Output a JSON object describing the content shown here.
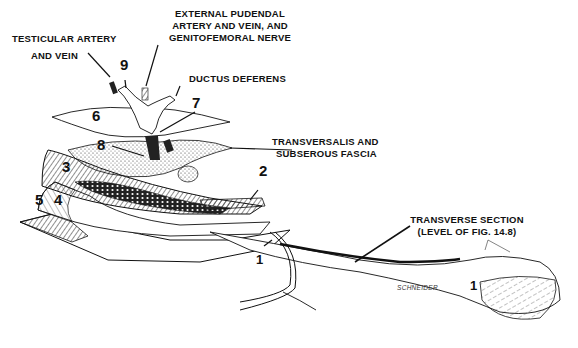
{
  "figure": {
    "labels": {
      "external_pudendal_line1": "EXTERNAL PUDENDAL",
      "external_pudendal_line2": "ARTERY AND VEIN, AND",
      "external_pudendal_line3": "GENITOFEMORAL NERVE",
      "testicular_line1": "TESTICULAR ARTERY",
      "testicular_line2": "AND VEIN",
      "ductus_deferens": "DUCTUS DEFERENS",
      "transversalis_line1": "TRANSVERSALIS AND",
      "transversalis_line2": "SUBSEROUS FASCIA",
      "transverse_section_line1": "TRANSVERSE SECTION",
      "transverse_section_line2": "(LEVEL OF FIG. 14.8)"
    },
    "numbers": {
      "n1_left": "1",
      "n1_right": "1",
      "n2": "2",
      "n3": "3",
      "n4": "4",
      "n5": "5",
      "n6": "6",
      "n7": "7",
      "n8": "8",
      "n9": "9"
    },
    "signature": "SCHNEIDER",
    "colors": {
      "ink": "#111111",
      "background": "#ffffff"
    }
  }
}
